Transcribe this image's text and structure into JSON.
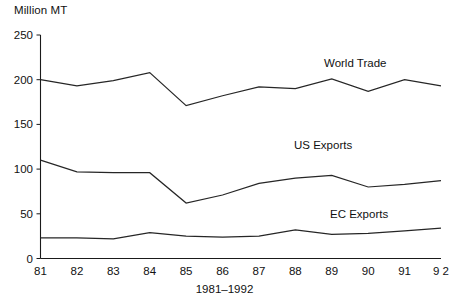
{
  "chart_data": {
    "type": "line",
    "title": "",
    "xlabel": "1981–1992",
    "ylabel": "Million MT",
    "ylim": [
      0,
      250
    ],
    "yticks": [
      0,
      50,
      100,
      150,
      200,
      250
    ],
    "ytick_labels": [
      "0",
      "50",
      "100",
      "150",
      "200",
      "250"
    ],
    "grid": false,
    "legend_position": "inline-annotations",
    "categories": [
      "81",
      "82",
      "83",
      "84",
      "85",
      "86",
      "87",
      "88",
      "89",
      "90",
      "91",
      "9 2"
    ],
    "x": [
      1981,
      1982,
      1983,
      1984,
      1985,
      1986,
      1987,
      1988,
      1989,
      1990,
      1991,
      1992
    ],
    "series": [
      {
        "name": "World Trade",
        "values": [
          200,
          193,
          199,
          208,
          171,
          182,
          192,
          190,
          201,
          187,
          200,
          193
        ]
      },
      {
        "name": "US Exports",
        "values": [
          110,
          97,
          96,
          96,
          62,
          71,
          84,
          90,
          93,
          80,
          83,
          87
        ]
      },
      {
        "name": "EC Exports",
        "values": [
          23,
          23,
          22,
          29,
          25,
          24,
          25,
          32,
          27,
          28,
          31,
          34
        ]
      }
    ],
    "annotations": [
      {
        "text": "World Trade",
        "x_px": 324,
        "y_px": 57
      },
      {
        "text": "US Exports",
        "x_px": 294,
        "y_px": 139
      },
      {
        "text": "EC Exports",
        "x_px": 330,
        "y_px": 208
      }
    ]
  },
  "axis": {
    "unit_label": "Million MT",
    "x_title": "1981–1992"
  },
  "colors": {
    "line": "#262626",
    "axis": "#1a1a1a",
    "text": "#111111",
    "background": "#ffffff"
  }
}
